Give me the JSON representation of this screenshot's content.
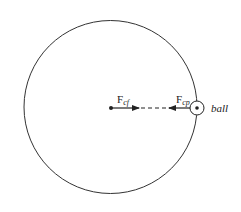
{
  "diagram": {
    "type": "circular-motion-forces",
    "labels": {
      "centrifugal_force": "F",
      "centrifugal_sub": "cf",
      "centripetal_force": "F",
      "centripetal_sub": "cp",
      "ball": "ball"
    },
    "colors": {
      "stroke": "#222222",
      "background": "#ffffff"
    }
  }
}
